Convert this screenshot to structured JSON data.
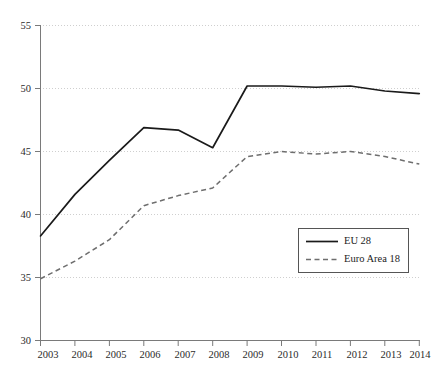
{
  "chart_data": {
    "type": "line",
    "title": "",
    "subtitle": "",
    "xlabel": "",
    "ylabel": "",
    "x": [
      "2003",
      "2004",
      "2005",
      "2006",
      "2007",
      "2008",
      "2009",
      "2010",
      "2011",
      "2012",
      "2013",
      "2014"
    ],
    "categories": [
      "2003",
      "2004",
      "2005",
      "2006",
      "2007",
      "2008",
      "2009",
      "2010",
      "2011",
      "2012",
      "2013",
      "2014"
    ],
    "series": [
      {
        "name": "EU 28",
        "style": "solid",
        "color": "#1a1a1a",
        "values": [
          38.3,
          41.6,
          44.3,
          46.9,
          46.7,
          45.3,
          50.2,
          50.2,
          50.1,
          50.2,
          49.8,
          49.6
        ]
      },
      {
        "name": "Euro Area 18",
        "style": "dashed",
        "color": "#6e6e6e",
        "values": [
          34.9,
          36.3,
          38.0,
          40.7,
          41.5,
          42.1,
          44.6,
          45.0,
          44.8,
          45.0,
          44.6,
          44.0
        ]
      }
    ],
    "ylim": [
      30,
      55
    ],
    "yticks": [
      30,
      35,
      40,
      45,
      50,
      55
    ],
    "ytick_labels": [
      "30",
      "35",
      "40",
      "45",
      "50",
      "55"
    ],
    "xtick_labels": [
      "2003",
      "2004",
      "2005",
      "2006",
      "2007",
      "2008",
      "2009",
      "2010",
      "2011",
      "2012",
      "2013",
      "2014"
    ],
    "grid": "horizontal-dotted",
    "legend_position": "lower-right-inside",
    "legend_entries": [
      "EU 28",
      "Euro Area 18"
    ]
  },
  "legend": {
    "entries": [
      {
        "label": "EU 28"
      },
      {
        "label": "Euro Area 18"
      }
    ]
  },
  "axes": {
    "y_labels": [
      "55",
      "50",
      "45",
      "40",
      "35",
      "30"
    ],
    "x_labels": [
      "2003",
      "2004",
      "2005",
      "2006",
      "2007",
      "2008",
      "2009",
      "2010",
      "2011",
      "2012",
      "2013",
      "2014"
    ]
  }
}
